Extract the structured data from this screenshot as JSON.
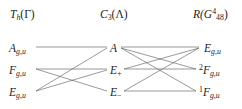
{
  "figure": {
    "background_color": "#ffffff",
    "line_color": "#4a4a4a",
    "text_color": "#1c1c1c"
  },
  "headers": {
    "left": "T_h(Γ)",
    "middle": "C_3(Λ)",
    "right": "R(G^4_48)"
  },
  "columns": {
    "left": {
      "header_label": "Th(Γ)",
      "nodes": [
        {
          "label": "Ag,u",
          "base": "A",
          "sub": "g,u",
          "presup": ""
        },
        {
          "label": "Fg,u",
          "base": "F",
          "sub": "g,u",
          "presup": ""
        },
        {
          "label": "Eg,u",
          "base": "E",
          "sub": "g,u",
          "presup": ""
        }
      ]
    },
    "middle": {
      "header_label": "C3(Λ)",
      "nodes": [
        {
          "label": "A",
          "base": "A",
          "sub": "",
          "presup": ""
        },
        {
          "label": "E+",
          "base": "E",
          "sub": "+",
          "presup": ""
        },
        {
          "label": "E−",
          "base": "E",
          "sub": "−",
          "presup": ""
        }
      ]
    },
    "right": {
      "header_label": "R(G448)",
      "nodes": [
        {
          "label": "Eg,u",
          "base": "E",
          "sub": "g,u",
          "presup": ""
        },
        {
          "label": "2Fg,u",
          "base": "F",
          "sub": "g,u",
          "presup": "2"
        },
        {
          "label": "1Fg,u",
          "base": "F",
          "sub": "g,u",
          "presup": "1"
        }
      ]
    }
  },
  "header_parts": {
    "left_base": "T",
    "left_sub": "h",
    "left_arg": "(Γ)",
    "middle_base": "C",
    "middle_sub": "3",
    "middle_arg": "(Λ)",
    "right_base": "R(G",
    "right_sup": "4",
    "right_sub": "48",
    "right_close": ")"
  },
  "connections": {
    "left_group": [
      {
        "from": "A_gu",
        "to": "A"
      },
      {
        "from": "F_gu",
        "to": "E_plus"
      },
      {
        "from": "F_gu",
        "to": "E_minus"
      },
      {
        "from": "E_gu",
        "to": "A"
      },
      {
        "from": "E_gu",
        "to": "E_plus"
      }
    ],
    "right_group": [
      {
        "from": "A",
        "to": "E_gu"
      },
      {
        "from": "A",
        "to": "F2_gu"
      },
      {
        "from": "A",
        "to": "F1_gu"
      },
      {
        "from": "E_plus",
        "to": "E_gu"
      },
      {
        "from": "E_plus",
        "to": "F2_gu"
      },
      {
        "from": "E_minus",
        "to": "E_gu"
      },
      {
        "from": "E_minus",
        "to": "F1_gu"
      }
    ]
  }
}
